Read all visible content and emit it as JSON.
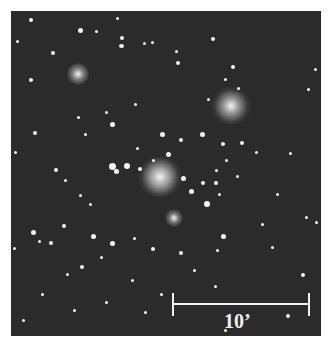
{
  "image": {
    "subject": "star-cluster-field",
    "background_color": "#2b2b2b",
    "star_color": "#f4f4f4"
  },
  "scale_bar": {
    "label": "10’",
    "color": "#f2f2f2"
  },
  "bright_stars": [
    {
      "x": 160,
      "y": 177,
      "r": 10
    },
    {
      "x": 231,
      "y": 103,
      "r": 7
    },
    {
      "x": 77,
      "y": 73,
      "r": 5
    }
  ]
}
